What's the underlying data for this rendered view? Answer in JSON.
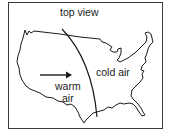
{
  "diagram": {
    "title": "top view",
    "regions": [
      {
        "id": "warm",
        "label_line1": "warm",
        "label_line2": "air"
      },
      {
        "id": "cold",
        "label": "cold air"
      }
    ],
    "arrow": {
      "direction": "right",
      "meaning": "warm air movement"
    },
    "front_line": {
      "type": "curved boundary between warm and cold air"
    },
    "map": "outline of contiguous United States",
    "colors": {
      "line": "#1a1a1a",
      "background": "#ffffff"
    }
  }
}
